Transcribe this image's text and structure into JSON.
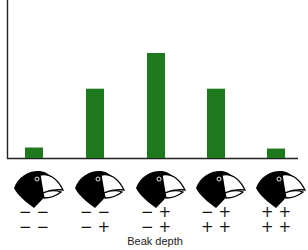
{
  "chart_data": {
    "type": "bar",
    "title": "",
    "xlabel": "Beak depth",
    "ylabel": "",
    "categories": [
      "− − / − −",
      "− − / − +",
      "− + / − +",
      "− + / + +",
      "+ + / + +"
    ],
    "genotypes": [
      {
        "top": "− −",
        "bottom": "− −"
      },
      {
        "top": "− −",
        "bottom": "− +"
      },
      {
        "top": "− +",
        "bottom": "− +"
      },
      {
        "top": "− +",
        "bottom": "+ +"
      },
      {
        "top": "+ +",
        "bottom": "+ +"
      }
    ],
    "values": [
      1,
      6.6,
      10,
      6.6,
      0.9
    ],
    "ylim": [
      0,
      10
    ],
    "grid": false,
    "legend": "none",
    "bar_color": "#1f7a1f",
    "category_icons": [
      "finch-head-icon",
      "finch-head-icon",
      "finch-head-icon",
      "finch-head-icon",
      "finch-head-icon"
    ]
  }
}
